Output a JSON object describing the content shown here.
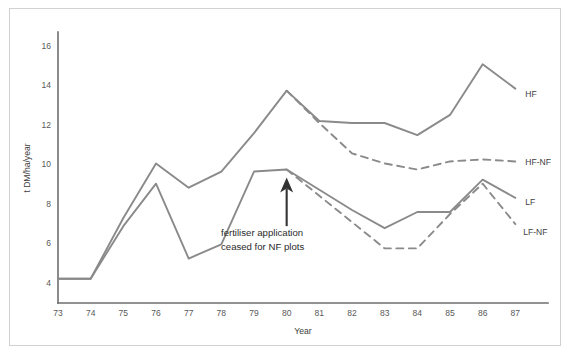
{
  "chart_data": {
    "type": "line",
    "title": "",
    "xlabel": "Year",
    "ylabel": "t DM/ha/year",
    "x": [
      73,
      74,
      75,
      76,
      77,
      78,
      79,
      80,
      81,
      82,
      83,
      84,
      85,
      86,
      87
    ],
    "xticklabels": [
      "73",
      "74",
      "75",
      "76",
      "77",
      "78",
      "79",
      "80",
      "81",
      "82",
      "83",
      "84",
      "85",
      "86",
      "87"
    ],
    "yticklabels": [
      "4",
      "6",
      "8",
      "10",
      "12",
      "14",
      "16"
    ],
    "yticks": [
      4,
      6,
      8,
      10,
      12,
      14,
      16
    ],
    "xlim": [
      73,
      88
    ],
    "ylim": [
      3.4,
      16.8
    ],
    "grid": false,
    "legend_position": "right-inline-labels",
    "line_color": "#8a8a8a",
    "series": [
      {
        "name": "HF",
        "label": "HF",
        "style": "solid",
        "x": [
          73,
          74,
          75,
          76,
          77,
          78,
          79,
          80,
          81,
          82,
          83,
          84,
          85,
          86,
          87
        ],
        "values": [
          4.6,
          4.6,
          7.6,
          10.3,
          9.1,
          9.9,
          11.8,
          13.9,
          12.4,
          12.3,
          12.3,
          11.7,
          12.7,
          15.2,
          14.0
        ]
      },
      {
        "name": "HF-NF",
        "label": "HF-NF",
        "style": "dashed",
        "x": [
          80,
          81,
          82,
          83,
          84,
          85,
          86,
          87
        ],
        "values": [
          13.9,
          12.3,
          10.8,
          10.3,
          10.0,
          10.4,
          10.5,
          10.4
        ]
      },
      {
        "name": "LF",
        "label": "LF",
        "style": "solid",
        "x": [
          73,
          74,
          75,
          76,
          77,
          78,
          79,
          80,
          81,
          82,
          83,
          84,
          85,
          86,
          87
        ],
        "values": [
          4.6,
          4.6,
          7.2,
          9.3,
          5.6,
          6.3,
          9.9,
          10.0,
          9.0,
          8.0,
          7.1,
          7.9,
          7.9,
          9.5,
          8.6
        ]
      },
      {
        "name": "LF-NF",
        "label": "LF-NF",
        "style": "dashed",
        "x": [
          80,
          81,
          82,
          83,
          84,
          85,
          86,
          87
        ],
        "values": [
          10.0,
          8.7,
          7.4,
          6.1,
          6.1,
          7.8,
          9.3,
          7.3
        ]
      }
    ],
    "annotations": [
      {
        "name": "fertiliser-ceased",
        "lines": [
          "fertiliser application",
          "ceased for NF plots"
        ],
        "text": "fertiliser application ceased for NF plots",
        "arrow": {
          "x": 80,
          "y_tail": 7.2,
          "y_head": 9.6,
          "direction": "up"
        }
      }
    ]
  }
}
